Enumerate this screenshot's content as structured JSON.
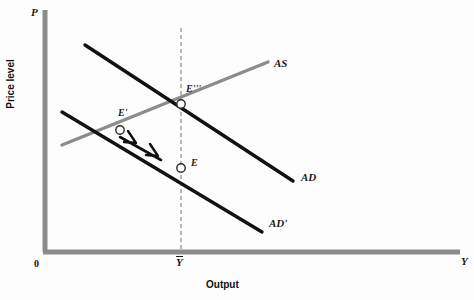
{
  "figure": {
    "type": "economics-ad-as-diagram",
    "background_color": "#fdfdfd"
  },
  "axes": {
    "y_axis_symbol": "P",
    "y_axis_title": "Price level",
    "x_axis_symbol": "Y",
    "x_axis_title": "Output",
    "origin_label": "0",
    "axis_color": "#8c8c8c",
    "origin_px": {
      "x": 45,
      "y": 252
    },
    "y_top_px": {
      "x": 45,
      "y": 10
    },
    "x_right_px": {
      "x": 460,
      "y": 252
    }
  },
  "curves": [
    {
      "id": "AS",
      "label": "AS",
      "label_px": {
        "x": 274,
        "y": 63
      },
      "color": "#8c8c8c",
      "width": 3.2,
      "slope": "upward",
      "start_px": {
        "x": 62,
        "y": 145
      },
      "end_px": {
        "x": 268,
        "y": 62
      }
    },
    {
      "id": "AD",
      "label": "AD",
      "label_px": {
        "x": 301,
        "y": 176
      },
      "color": "#111111",
      "width": 3.2,
      "slope": "downward",
      "start_px": {
        "x": 85,
        "y": 45
      },
      "end_px": {
        "x": 293,
        "y": 181
      }
    },
    {
      "id": "AD'",
      "label": "AD'",
      "label_px": {
        "x": 269,
        "y": 222
      },
      "color": "#111111",
      "width": 3.2,
      "slope": "downward",
      "start_px": {
        "x": 62,
        "y": 112
      },
      "end_px": {
        "x": 262,
        "y": 232
      }
    }
  ],
  "vertical_line": {
    "id": "potential-output",
    "label": "Ȳ",
    "label_plain": "Y",
    "label_px": {
      "x": 181,
      "y": 258
    },
    "x_px": 181,
    "top_px": 28,
    "bottom_px": 252,
    "style": "dashed",
    "color": "#9a9a9a"
  },
  "points": [
    {
      "id": "E-triple-prime",
      "label": "E'''",
      "label_base": "E",
      "label_primes": "‴",
      "px": {
        "x": 181,
        "y": 104
      },
      "label_px": {
        "x": 186,
        "y": 88
      },
      "marker": "open-circle"
    },
    {
      "id": "E-prime",
      "label": "E'",
      "label_base": "E",
      "label_primes": "′",
      "px": {
        "x": 120,
        "y": 130
      },
      "label_px": {
        "x": 121,
        "y": 112
      },
      "marker": "open-circle"
    },
    {
      "id": "E",
      "label": "E",
      "label_base": "E",
      "label_primes": "",
      "px": {
        "x": 181,
        "y": 168
      },
      "label_px": {
        "x": 190,
        "y": 160
      },
      "marker": "open-circle"
    }
  ],
  "arrow": {
    "id": "adjustment-arrow",
    "description": "double-chevron arrow from E' toward E",
    "start_px": {
      "x": 120,
      "y": 137
    },
    "end_px": {
      "x": 163,
      "y": 161
    },
    "color": "#111111"
  }
}
